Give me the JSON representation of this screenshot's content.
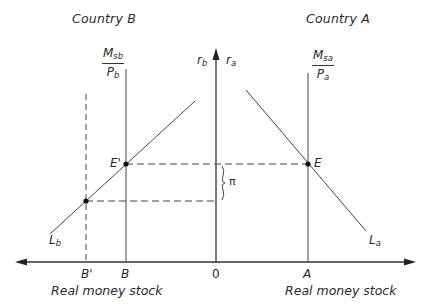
{
  "diagram": {
    "titles": {
      "left": "Country B",
      "right": "Country A"
    },
    "axis": {
      "vertical_left_label": {
        "base": "r",
        "sub": "b"
      },
      "vertical_right_label": {
        "base": "r",
        "sub": "a"
      },
      "origin": "0",
      "x_label_left": "Real money stock",
      "x_label_right": "Real money stock"
    },
    "supply": {
      "b": {
        "num_base": "M",
        "num_sub": "sb",
        "den_base": "P",
        "den_sub": "b"
      },
      "a": {
        "num_base": "M",
        "num_sub": "sa",
        "den_base": "P",
        "den_sub": "a"
      }
    },
    "curves": {
      "lb": {
        "base": "L",
        "sub": "b"
      },
      "la": {
        "base": "L",
        "sub": "a"
      }
    },
    "points": {
      "e_prime": "E'",
      "e": "E"
    },
    "ticks": {
      "b_prime": "B'",
      "b": "B",
      "a": "A"
    },
    "gap_label": "π",
    "colors": {
      "line": "#3a3a3a",
      "background": "#ffffff"
    }
  }
}
